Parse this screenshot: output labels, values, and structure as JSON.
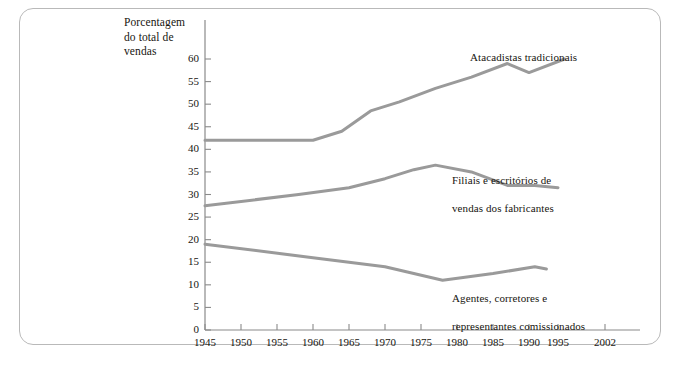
{
  "figure": {
    "frame_border_color": "#b9b9b9",
    "background": "#ffffff",
    "line_color": "#9a9a9a",
    "axis_color": "#8a8a8a",
    "text_color": "#17150f"
  },
  "axis_title": "Porcentagem\ndo total de\nvendas",
  "axis_title_line1": "Porcentagem",
  "axis_title_line2": "do total de",
  "axis_title_line3": "vendas",
  "labels": {
    "top": "Atacadistas tradicionais",
    "mid_line1": "Filiais e escritórios de",
    "mid_line2": "vendas dos fabricantes",
    "bot_line1": "Agentes, corretores e",
    "bot_line2": "representantes comissionados"
  },
  "chart_data": {
    "type": "line",
    "title": "",
    "subtitle": "",
    "xlabel": "",
    "ylabel": "Porcentagem do total de vendas",
    "grid": false,
    "legend_position": "inline-right",
    "xlim": [
      1945,
      2002
    ],
    "ylim": [
      0,
      62
    ],
    "yticks": [
      0,
      5,
      10,
      15,
      20,
      25,
      30,
      35,
      40,
      45,
      50,
      55,
      60
    ],
    "xticks": [
      1945,
      1950,
      1955,
      1960,
      1965,
      1970,
      1975,
      1980,
      1985,
      1990,
      1995,
      2002
    ],
    "xtick_labels": [
      "1945",
      "1950",
      "1955",
      "1960",
      "1965",
      "1970",
      "1975",
      "1980",
      "1985",
      "1990",
      "1995",
      "2002"
    ],
    "series": [
      {
        "name": "Atacadistas tradicionais",
        "color": "#9a9a9a",
        "x": [
          1945,
          1960,
          1964,
          1968,
          1972,
          1977,
          1982,
          1987,
          1990,
          1996
        ],
        "values": [
          42.0,
          42.0,
          44.0,
          48.5,
          50.5,
          53.5,
          56.0,
          59.0,
          57.0,
          60.0
        ]
      },
      {
        "name": "Filiais e escritórios de vendas dos fabricantes",
        "color": "#9a9a9a",
        "x": [
          1945,
          1958,
          1965,
          1970,
          1974,
          1977,
          1982,
          1987,
          1991,
          1995
        ],
        "values": [
          27.5,
          30.0,
          31.5,
          33.5,
          35.5,
          36.5,
          35.0,
          32.0,
          32.0,
          31.5
        ]
      },
      {
        "name": "Agentes, corretores e representantes comissionados",
        "color": "#9a9a9a",
        "x": [
          1945,
          1960,
          1965,
          1970,
          1978,
          1985,
          1991,
          1993
        ],
        "values": [
          19.0,
          16.0,
          15.0,
          14.0,
          11.0,
          12.5,
          14.0,
          13.5
        ]
      }
    ]
  }
}
